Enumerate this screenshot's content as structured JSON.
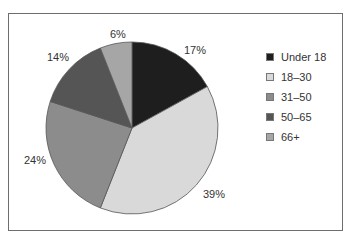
{
  "chart_data": {
    "type": "pie",
    "title": "",
    "categories": [
      "Under 18",
      "18–30",
      "31–50",
      "50–65",
      "66+"
    ],
    "values": [
      17,
      39,
      24,
      14,
      6
    ],
    "labels": [
      "17%",
      "39%",
      "24%",
      "14%",
      "6%"
    ],
    "colors": [
      "#1e1e1e",
      "#d9d9d9",
      "#8c8c8c",
      "#555555",
      "#a6a6a6"
    ],
    "start_angle": "12 o'clock, clockwise",
    "legend_position": "right"
  },
  "legend": {
    "items": [
      {
        "label": "Under 18",
        "color": "#1e1e1e"
      },
      {
        "label": "18–30",
        "color": "#d9d9d9"
      },
      {
        "label": "31–50",
        "color": "#8c8c8c"
      },
      {
        "label": "50–65",
        "color": "#555555"
      },
      {
        "label": "66+",
        "color": "#a6a6a6"
      }
    ]
  },
  "slice_labels": [
    "17%",
    "39%",
    "24%",
    "14%",
    "6%"
  ]
}
